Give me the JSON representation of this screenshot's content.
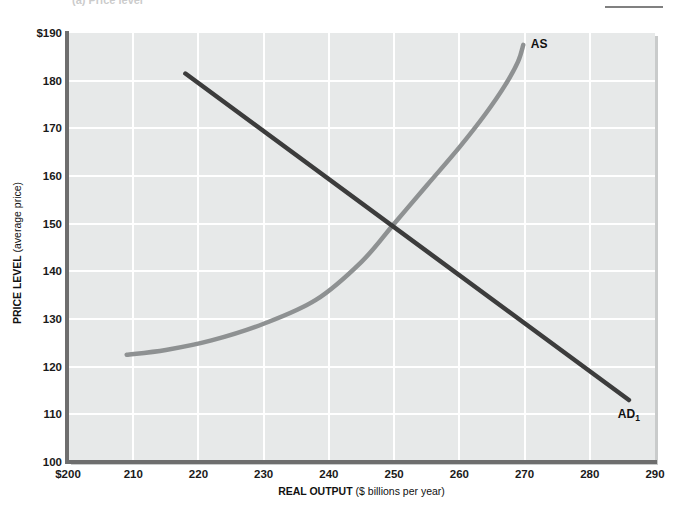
{
  "caption": "(a) Price level",
  "chart_data": {
    "type": "line",
    "title": "",
    "subtitle": "",
    "xlabel": "REAL OUTPUT",
    "xlabel_unit": "($ billions per year)",
    "ylabel": "PRICE LEVEL",
    "ylabel_unit": "(average price)",
    "xlim": [
      200,
      290
    ],
    "ylim": [
      100,
      190
    ],
    "xticks": [
      "$200",
      "210",
      "220",
      "230",
      "240",
      "250",
      "260",
      "270",
      "280",
      "290"
    ],
    "xtick_values": [
      200,
      210,
      220,
      230,
      240,
      250,
      260,
      270,
      280,
      290
    ],
    "yticks": [
      "$190",
      "180",
      "170",
      "160",
      "150",
      "140",
      "130",
      "120",
      "110",
      "100"
    ],
    "ytick_values": [
      190,
      180,
      170,
      160,
      150,
      140,
      130,
      120,
      110,
      100
    ],
    "grid": true,
    "grid_color": "#ffffff",
    "plot_background": "#e7e9e9",
    "legend_position": "inline-labels",
    "equilibrium": {
      "x": 250,
      "y": 150
    },
    "series": [
      {
        "name": "AS",
        "label": "AS",
        "color": "#8e9192",
        "description": "Aggregate supply curve, upward sloping and becoming vertical at high output",
        "points": [
          {
            "x": 209,
            "y": 122.5
          },
          {
            "x": 215,
            "y": 123.5
          },
          {
            "x": 222,
            "y": 125.5
          },
          {
            "x": 230,
            "y": 129
          },
          {
            "x": 238,
            "y": 134
          },
          {
            "x": 245,
            "y": 142
          },
          {
            "x": 250,
            "y": 150
          },
          {
            "x": 255,
            "y": 158
          },
          {
            "x": 260,
            "y": 166
          },
          {
            "x": 264,
            "y": 173
          },
          {
            "x": 267,
            "y": 179
          },
          {
            "x": 269,
            "y": 184
          },
          {
            "x": 269.8,
            "y": 187.5
          }
        ]
      },
      {
        "name": "AD1",
        "label": "AD",
        "label_subscript": "1",
        "color": "#3c3c3c",
        "description": "Aggregate demand curve, downward sloping straight line",
        "points": [
          {
            "x": 218,
            "y": 181.5
          },
          {
            "x": 286,
            "y": 113
          }
        ]
      }
    ]
  },
  "curve_labels": {
    "as": "AS",
    "ad_base": "AD",
    "ad_sub": "1"
  }
}
